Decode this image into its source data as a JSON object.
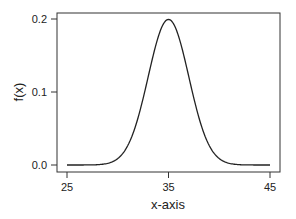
{
  "chart_data": {
    "type": "line",
    "title": "",
    "xlabel": "x-axis",
    "ylabel": "f(x)",
    "xlim": [
      24.2,
      45.4
    ],
    "ylim": [
      -0.008,
      0.21
    ],
    "grid": false,
    "legend": null,
    "x_ticks": [
      25,
      35,
      45
    ],
    "x_tick_labels": [
      "25",
      "35",
      "45"
    ],
    "y_ticks": [
      0.0,
      0.1,
      0.2
    ],
    "y_tick_labels": [
      "0.0",
      "0.1",
      "0.2"
    ],
    "series": [
      {
        "name": "Normal density (mean 35, sd 2)",
        "distribution": {
          "mean": 35,
          "sd": 2
        },
        "x": [
          25,
          27,
          29,
          30,
          31,
          32,
          33,
          34,
          35,
          36,
          37,
          38,
          39,
          40,
          41,
          43,
          45
        ],
        "y": [
          0.0,
          0.0001,
          0.0022,
          0.0088,
          0.027,
          0.0648,
          0.121,
          0.176,
          0.1995,
          0.176,
          0.121,
          0.0648,
          0.027,
          0.0088,
          0.0022,
          0.0001,
          0.0
        ]
      }
    ]
  },
  "axes": {
    "x_label": "x-axis",
    "y_label": "f(x)"
  }
}
